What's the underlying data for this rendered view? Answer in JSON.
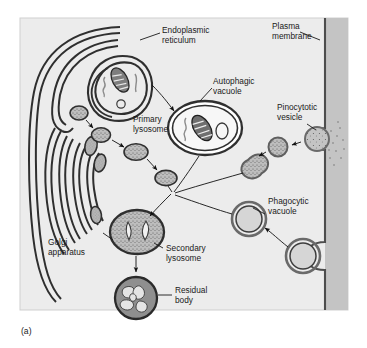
{
  "figure": {
    "caption": "(a)",
    "panel_background": "#ececec",
    "page_background": "#ffffff",
    "frame_border": "#c9c9c9",
    "membrane_band_color": "#c4c4c4",
    "membrane_line_color": "#4d4d4d",
    "organelle_fill": "#b4b4b4",
    "organelle_stroke": "#3a3a3a",
    "lumen_fill": "#e2e2e2",
    "label_color": "#1a1a1a"
  },
  "labels": {
    "endoplasmic_reticulum": {
      "line1": "Endoplasmic",
      "line2": "reticulum"
    },
    "plasma_membrane": {
      "line1": "Plasma",
      "line2": "membrane"
    },
    "autophagic_vacuole": {
      "line1": "Autophagic",
      "line2": "vacuole"
    },
    "primary_lysosome": {
      "line1": "Primary",
      "line2": "lysosome"
    },
    "pinocytotic_vesicle": {
      "line1": "Pinocytotic",
      "line2": "vesicle"
    },
    "phagocytic_vacuole": {
      "line1": "Phagocytic",
      "line2": "vacuole"
    },
    "golgi_apparatus": {
      "line1": "Golgi",
      "line2": "apparatus"
    },
    "secondary_lysosome": {
      "line1": "Secondary",
      "line2": "lysosome"
    },
    "residual_body": {
      "line1": "Residual",
      "line2": "body"
    }
  },
  "structures": {
    "endoplasmic_reticulum": "double-membrane curved cisternae at upper left wrapping a mitochondrion",
    "golgi_apparatus": "stack of nested curved cisternae at left with budding stippled vesicles",
    "primary_lysosome": "chain of small stippled vesicles travelling right and down",
    "autophagic_vacuole": "large oval vacuole containing a mitochondrion and a small vesicle",
    "pinocytotic_vesicle": "small stippled vesicles budding inward from the plasma membrane",
    "phagocytic_vacuole": "large ring vacuoles invaginating from the plasma membrane",
    "secondary_lysosome": "large stippled oval with two pale inclusions",
    "residual_body": "dark round body filled with irregular pale debris",
    "plasma_membrane": "vertical grey band along the right edge"
  }
}
